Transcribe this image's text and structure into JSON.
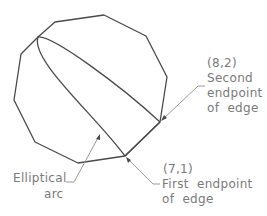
{
  "diagram": {
    "type": "geometry-annotation",
    "colors": {
      "shape": "#4a4a4a",
      "leader": "#9a9a9a",
      "text": "#7a7a7a"
    },
    "polygon": {
      "name": "decagon",
      "vertices": [
        [
          104,
          15
        ],
        [
          146,
          36
        ],
        [
          167,
          77
        ],
        [
          160,
          122
        ],
        [
          125,
          156
        ],
        [
          78,
          163
        ],
        [
          35,
          142
        ],
        [
          14,
          100
        ],
        [
          21,
          54
        ],
        [
          38,
          37
        ],
        [
          55,
          22
        ]
      ]
    },
    "elliptical_arc": {
      "start": [
        38,
        37
      ],
      "upper_end": [
        160,
        122
      ],
      "lower_end": [
        125,
        156
      ]
    },
    "callouts": [
      {
        "id": "second-endpoint",
        "coord": "(8,2)",
        "lines": [
          "Second",
          "endpoint",
          "of  edge"
        ]
      },
      {
        "id": "first-endpoint",
        "coord": "(7,1)",
        "lines": [
          "First  endpoint",
          "of  edge"
        ]
      },
      {
        "id": "elliptical-arc",
        "lines": [
          "Elliptical",
          "arc"
        ]
      }
    ]
  }
}
